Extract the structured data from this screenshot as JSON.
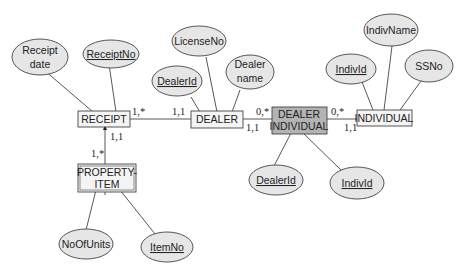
{
  "entities": {
    "receipt": {
      "label": "RECEIPT"
    },
    "dealer": {
      "label": "DEALER"
    },
    "dealer_individual": {
      "line1": "DEALER",
      "line2": "INDIVIDUAL",
      "fill": "#b3b3b3"
    },
    "individual": {
      "label": "INDIVIDUAL"
    },
    "property_item": {
      "line1": "PROPERTY-",
      "line2": "ITEM"
    }
  },
  "attributes": {
    "receipt_date": {
      "line1": "Receipt",
      "line2": "date",
      "key": false
    },
    "receipt_no": {
      "label": "ReceiptNo",
      "key": true
    },
    "license_no": {
      "label": "LicenseNo",
      "key": false
    },
    "dealer_id": {
      "label": "DealerId",
      "key": true
    },
    "dealer_name": {
      "line1": "Dealer",
      "line2": "name",
      "key": false
    },
    "indiv_name": {
      "label": "IndivName",
      "key": false
    },
    "indiv_id": {
      "label": "IndivId",
      "key": true
    },
    "ssno": {
      "label": "SSNo",
      "key": false
    },
    "di_dealer_id": {
      "label": "DealerId",
      "key": true
    },
    "di_indiv_id": {
      "label": "IndivId",
      "key": true
    },
    "no_of_units": {
      "label": "NoOfUnits",
      "key": false
    },
    "item_no": {
      "label": "ItemNo",
      "key": true
    }
  },
  "cardinalities": {
    "receipt_dealer_near_receipt": "1,*",
    "receipt_dealer_near_dealer": "1,1",
    "dealer_di_top": "0,*",
    "dealer_di_bottom": "1,1",
    "di_individual_top": "0,*",
    "di_individual_bottom": "1,1",
    "receipt_property_near_receipt": "1,1",
    "receipt_property_near_property": "1,*"
  }
}
